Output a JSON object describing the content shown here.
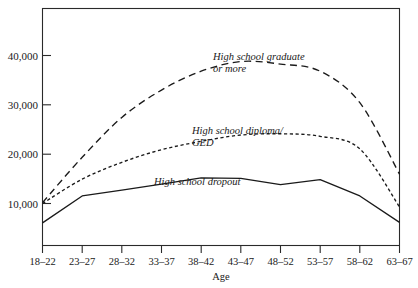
{
  "chart_data": {
    "type": "line",
    "title": "",
    "xlabel": "Age",
    "ylabel": "",
    "grid": false,
    "legend_position": "inline-annotations",
    "categories": [
      "18–22",
      "23–27",
      "28–32",
      "33–37",
      "38–42",
      "43–47",
      "48–52",
      "53–57",
      "58–62",
      "63–67"
    ],
    "xlim": [
      0,
      9
    ],
    "ylim": [
      0,
      48000
    ],
    "yticks": [
      10000,
      20000,
      30000,
      40000
    ],
    "ytick_labels": [
      "10,000",
      "20,000",
      "30,000",
      "40,000"
    ],
    "series": [
      {
        "name": "High school graduate or more",
        "style": "long-dash",
        "label_lines": [
          "High school graduate",
          "or more"
        ],
        "values": [
          10200,
          21000,
          30500,
          37000,
          41500,
          43800,
          43200,
          41500,
          34000,
          17000
        ]
      },
      {
        "name": "High school diploma/GED",
        "style": "short-dash",
        "label_lines": [
          "High school diploma/",
          "GED"
        ],
        "values": [
          10000,
          15800,
          19800,
          22800,
          24800,
          26300,
          26600,
          26000,
          23000,
          9200
        ]
      },
      {
        "name": "High school dropout",
        "style": "solid",
        "label_lines": [
          "High school dropout"
        ],
        "values": [
          5400,
          11800,
          13200,
          14600,
          16100,
          16000,
          14500,
          15700,
          11800,
          5500
        ]
      }
    ]
  },
  "annotations": {
    "graduate": {
      "line1": "High school graduate",
      "line2": "or more"
    },
    "diploma": {
      "line1": "High school diploma/",
      "line2": "GED"
    },
    "dropout": {
      "line1": "High school dropout"
    }
  },
  "axes": {
    "x_title": "Age",
    "xtick_labels": [
      "18–22",
      "23–27",
      "28–32",
      "33–37",
      "38–42",
      "43–47",
      "48–52",
      "53–57",
      "58–62",
      "63–67"
    ],
    "ytick_labels": [
      "10,000",
      "20,000",
      "30,000",
      "40,000"
    ]
  },
  "colors": {
    "line": "#1a1a1a",
    "frame": "#2a2a2a",
    "background": "#ffffff",
    "text": "#1a1a1a"
  }
}
